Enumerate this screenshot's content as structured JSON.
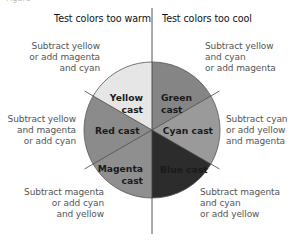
{
  "figure": {
    "top_cut_text": "Figure",
    "headers": {
      "left": "Test colors too warm",
      "right": "Test colors too cool"
    },
    "colors": {
      "yellow": "#e6e6e6",
      "green": "#8a8a8a",
      "cyan": "#9b9b9b",
      "blue": "#2e2e2e",
      "magenta": "#8e8e8e",
      "red": "#8c8c8c",
      "lines": "#444444",
      "outline": "#555555"
    },
    "segments": [
      {
        "id": "yellow",
        "line1": "Yellow",
        "line2": "cast"
      },
      {
        "id": "green",
        "line1": "Green",
        "line2": "cast"
      },
      {
        "id": "cyan",
        "line1": "Cyan cast",
        "line2": ""
      },
      {
        "id": "blue",
        "line1": "Blue cast",
        "line2": ""
      },
      {
        "id": "magenta",
        "line1": "Magenta",
        "line2": "cast"
      },
      {
        "id": "red",
        "line1": "Red cast",
        "line2": ""
      }
    ],
    "notes": {
      "yellow": "Subtract yellow\nor add magenta\nand cyan",
      "green": "Subtract yellow\nand cyan\nor add magenta",
      "red": "Subtract yellow\nand magenta\nor add cyan",
      "cyan": "Subtract cyan\nor add yellow\nand magenta",
      "magenta": "Subtract magenta\nor add cyan\nand yellow",
      "blue": "Subtract magenta\nand cyan\nor add yellow"
    }
  }
}
